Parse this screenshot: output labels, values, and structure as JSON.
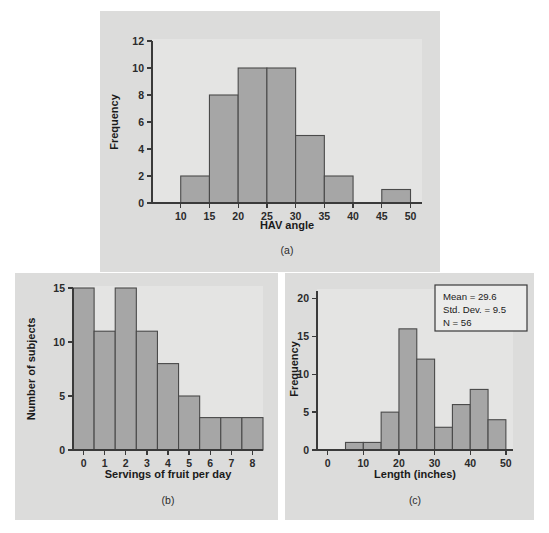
{
  "chart_data": [
    {
      "id": "a",
      "type": "bar",
      "title": "",
      "xlabel": "HAV angle",
      "ylabel": "Frequency",
      "caption": "(a)",
      "xlim": [
        5,
        52
      ],
      "ylim": [
        0,
        12
      ],
      "xticks": [
        10,
        15,
        20,
        25,
        30,
        35,
        40,
        45,
        50
      ],
      "yticks": [
        0,
        2,
        4,
        6,
        8,
        10,
        12
      ],
      "grid": false,
      "bin_width": 5,
      "bins": [
        {
          "start": 10,
          "end": 15,
          "value": 2
        },
        {
          "start": 15,
          "end": 20,
          "value": 8
        },
        {
          "start": 20,
          "end": 25,
          "value": 10
        },
        {
          "start": 25,
          "end": 30,
          "value": 10
        },
        {
          "start": 30,
          "end": 35,
          "value": 5
        },
        {
          "start": 35,
          "end": 40,
          "value": 2
        },
        {
          "start": 45,
          "end": 50,
          "value": 1
        }
      ]
    },
    {
      "id": "b",
      "type": "bar",
      "title": "",
      "xlabel": "Servings of fruit per day",
      "ylabel": "Number of subjects",
      "caption": "(b)",
      "xlim": [
        -0.5,
        8.5
      ],
      "ylim": [
        0,
        15
      ],
      "xticks": [
        0,
        1,
        2,
        3,
        4,
        5,
        6,
        7,
        8
      ],
      "yticks": [
        0,
        5,
        10,
        15
      ],
      "grid": false,
      "bin_width": 1,
      "categories": [
        0,
        1,
        2,
        3,
        4,
        5,
        6,
        7,
        8
      ],
      "values": [
        15,
        11,
        15,
        11,
        8,
        5,
        3,
        3,
        3
      ]
    },
    {
      "id": "c",
      "type": "bar",
      "title": "",
      "xlabel": "Length (inches)",
      "ylabel": "Frequency",
      "caption": "(c)",
      "xlim": [
        -3,
        52
      ],
      "ylim": [
        0,
        21
      ],
      "xticks": [
        0,
        10,
        20,
        30,
        40,
        50
      ],
      "yticks": [
        0,
        5,
        10,
        15,
        20
      ],
      "grid": false,
      "bin_width": 5,
      "bins": [
        {
          "start": 5,
          "end": 10,
          "value": 1
        },
        {
          "start": 10,
          "end": 15,
          "value": 1
        },
        {
          "start": 15,
          "end": 20,
          "value": 5
        },
        {
          "start": 20,
          "end": 25,
          "value": 16
        },
        {
          "start": 25,
          "end": 30,
          "value": 12
        },
        {
          "start": 30,
          "end": 35,
          "value": 3
        },
        {
          "start": 35,
          "end": 40,
          "value": 6
        },
        {
          "start": 40,
          "end": 45,
          "value": 8
        },
        {
          "start": 45,
          "end": 50,
          "value": 4
        }
      ],
      "stats_box": {
        "mean_label": "Mean = 29.6",
        "stddev_label": "Std. Dev. = 9.5",
        "n_label": "N = 56"
      }
    }
  ],
  "colors": {
    "bar_fill": "#a6a6a6",
    "bar_stroke": "#4a4a4a",
    "panel_bg": "#dcdcdb",
    "plot_bg": "#e4e4e3",
    "axis": "#3a3a3a",
    "text": "#1a1a1a",
    "page_bg": "#ffffff"
  }
}
